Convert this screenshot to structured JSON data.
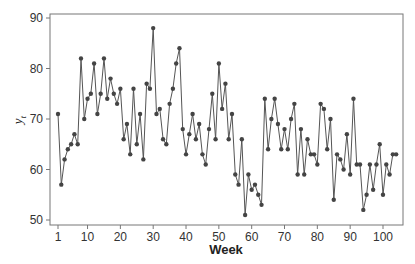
{
  "chart_data": {
    "type": "line",
    "title": "",
    "xlabel": "Week",
    "ylabel": "y_t",
    "ylabel_main": "y",
    "ylabel_sub": "t",
    "xlim": [
      1,
      104
    ],
    "ylim": [
      50,
      90
    ],
    "x_ticks": [
      1,
      10,
      20,
      30,
      40,
      50,
      60,
      70,
      80,
      90,
      100
    ],
    "y_ticks": [
      50,
      60,
      70,
      80,
      90
    ],
    "grid": false,
    "legend": null,
    "markers": true,
    "line_color": "#555555",
    "marker_color": "#444444",
    "values": [
      71,
      57,
      62,
      64,
      65,
      67,
      65,
      82,
      70,
      74,
      75,
      81,
      71,
      75,
      82,
      74,
      78,
      75,
      73,
      76,
      66,
      69,
      63,
      76,
      65,
      71,
      62,
      77,
      76,
      88,
      71,
      72,
      66,
      65,
      73,
      76,
      81,
      84,
      68,
      63,
      67,
      71,
      66,
      69,
      63,
      61,
      68,
      75,
      66,
      81,
      72,
      77,
      66,
      71,
      59,
      57,
      66,
      51,
      59,
      56,
      57,
      55,
      53,
      74,
      64,
      70,
      74,
      69,
      64,
      68,
      64,
      70,
      73,
      59,
      68,
      59,
      66,
      63,
      63,
      61,
      73,
      72,
      64,
      70,
      54,
      63,
      62,
      60,
      67,
      59,
      74,
      61,
      61,
      52,
      55,
      61,
      56,
      61,
      65,
      55,
      61,
      59,
      63,
      63
    ]
  }
}
